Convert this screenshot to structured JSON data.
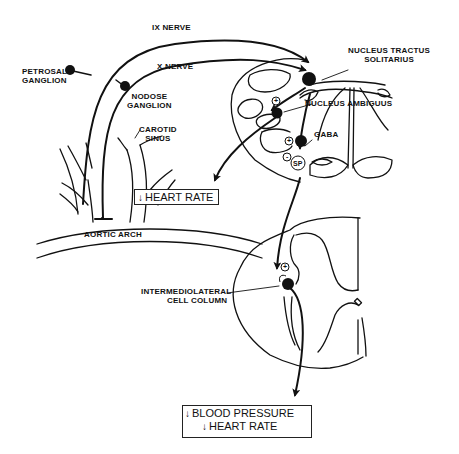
{
  "labels": {
    "ix_nerve": "IX NERVE",
    "x_nerve": "X NERVE",
    "petrosal_1": "PETROSAL",
    "petrosal_2": "GANGLION",
    "nodose_1": "NODOSE",
    "nodose_2": "GANGLION",
    "carotid_1": "CAROTID",
    "carotid_2": "SINUS",
    "aortic_arch": "AORTIC ARCH",
    "nts_1": "NUCLEUS TRACTUS",
    "nts_2": "SOLITARIUS",
    "nucleus_ambiguus": "NUCLEUS AMBIGUUS",
    "gaba": "GABA",
    "sp": "SP",
    "iml_1": "INTERMEDIOLATERAL",
    "iml_2": "CELL COLUMN",
    "plus": "+",
    "minus": "-"
  },
  "outputs": {
    "heart_rate_box": {
      "arrow": "↓",
      "text": "HEART RATE"
    },
    "final_box": {
      "line1": {
        "arrow": "↓",
        "text": "BLOOD PRESSURE"
      },
      "line2": {
        "arrow": "↓",
        "text": "HEART RATE"
      }
    }
  },
  "colors": {
    "ink": "#111111",
    "background": "#ffffff"
  }
}
